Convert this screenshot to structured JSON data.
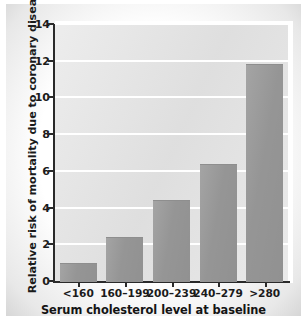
{
  "chart_data": {
    "type": "bar",
    "title": "",
    "xlabel": "Serum cholesterol level at baseline",
    "ylabel": "Relative risk of mortality due to coronary disease",
    "categories": [
      "<160",
      "160–199",
      "200–239",
      "240–279",
      ">280"
    ],
    "values": [
      1.0,
      2.4,
      4.4,
      6.4,
      11.8
    ],
    "ylim": [
      0,
      14
    ],
    "yticks": [
      0,
      2,
      4,
      6,
      8,
      10,
      12,
      14
    ],
    "ytick_labels": [
      "0",
      "2",
      "4",
      "6",
      "8",
      "10",
      "12",
      "14"
    ],
    "grid": "horizontal",
    "legend": "none",
    "colors": {
      "bar": "#9a9a9a",
      "plot_background": "#e3e3e3",
      "gridline": "#ffffff",
      "axis": "#2a2a2a",
      "text": "#1b1b1b",
      "page_background": "#ffffff"
    }
  }
}
